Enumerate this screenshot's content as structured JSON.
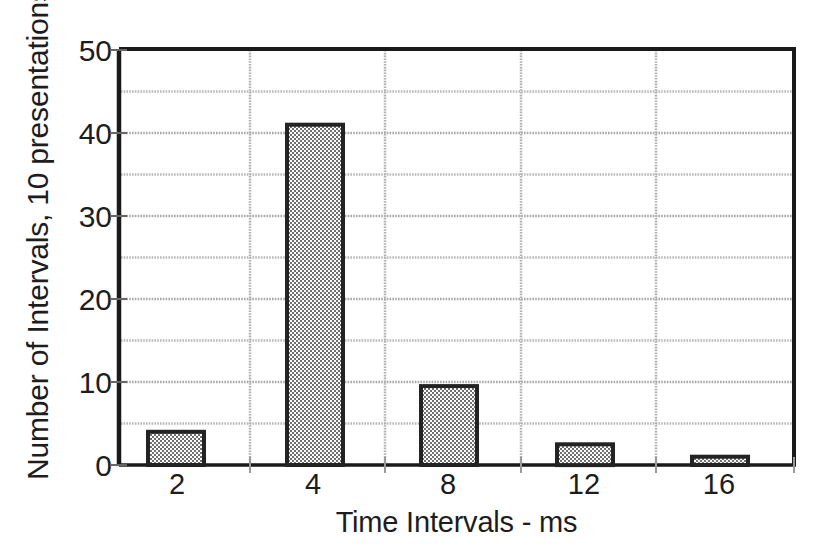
{
  "chart_data": {
    "type": "bar",
    "title": "",
    "subtitle": "",
    "xlabel": "Time Intervals - ms",
    "ylabel": "Number of Intervals, 10 presentations",
    "categories": [
      "2",
      "4",
      "8",
      "12",
      "16"
    ],
    "values": [
      4,
      41,
      9.5,
      2.5,
      1
    ],
    "series": [
      {
        "name": "Number of Intervals",
        "values": [
          4,
          41,
          9.5,
          2.5,
          1
        ]
      }
    ],
    "xlim": [
      0,
      5
    ],
    "ylim": [
      0,
      50
    ],
    "ytick_labels": [
      "0",
      "10",
      "20",
      "30",
      "40",
      "50"
    ],
    "ytick_values": [
      0,
      10,
      20,
      30,
      40,
      50
    ],
    "xtick_labels": [
      "2",
      "4",
      "8",
      "12",
      "16"
    ],
    "gridline_values": [
      0,
      5,
      10,
      15,
      20,
      25,
      30,
      35,
      40,
      45,
      50
    ],
    "grid": "horizontal-and-vertical",
    "legend": "none",
    "bar_fill": "#8c8c8c",
    "bar_edge": "#222222",
    "grid_color": "#b4b4b4",
    "axis_color": "#1a1a1a"
  },
  "axes": {
    "ylabel_text": "Number of Intervals, 10 presentations",
    "xlabel_text": "Time Intervals - ms"
  }
}
